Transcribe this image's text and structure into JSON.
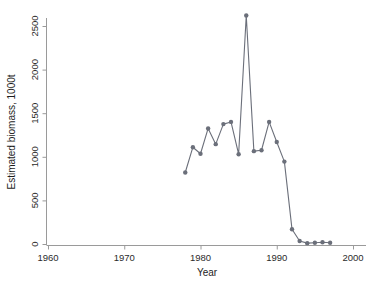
{
  "chart_data": {
    "type": "line",
    "title": "",
    "xlabel": "Year",
    "ylabel": "Estimated biomass, 1000t",
    "xlim": [
      1960,
      2000
    ],
    "ylim": [
      0,
      2750
    ],
    "xticks": [
      1960,
      1970,
      1980,
      1990,
      2000
    ],
    "yticks": [
      0,
      500,
      1000,
      1500,
      2000,
      2500
    ],
    "xtick_labels": [
      "1960",
      "1970",
      "1980",
      "1990",
      "2000"
    ],
    "ytick_labels": [
      "0",
      "500",
      "1000",
      "1500",
      "2000",
      "2500"
    ],
    "grid": false,
    "legend": null,
    "markers": "circle",
    "series": [
      {
        "name": "Estimated biomass",
        "color": "#6b6f7a",
        "x": [
          1978,
          1979,
          1980,
          1981,
          1982,
          1983,
          1984,
          1985,
          1986,
          1987,
          1988,
          1989,
          1990,
          1991,
          1992,
          1993,
          1994,
          1995,
          1996,
          1997
        ],
        "values": [
          820,
          1110,
          1035,
          1325,
          1145,
          1375,
          1400,
          1030,
          2620,
          1065,
          1075,
          1400,
          1170,
          945,
          170,
          35,
          10,
          15,
          20,
          15
        ]
      }
    ]
  },
  "axes": {
    "x_axis_name": "Year",
    "y_axis_name": "Estimated biomass, 1000t"
  },
  "colors": {
    "series": "#6b6f7a",
    "axis": "#9a9a9a",
    "text": "#1d1d1d",
    "background": "#ffffff"
  }
}
